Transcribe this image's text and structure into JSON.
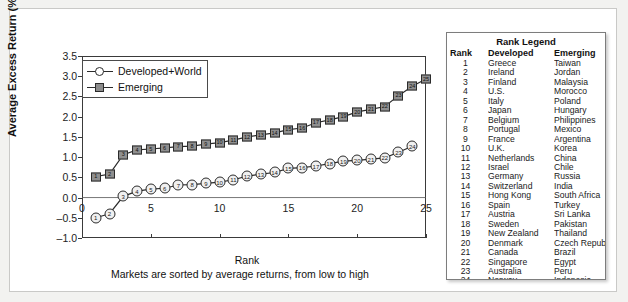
{
  "chart_data": {
    "type": "line",
    "title": "",
    "xlabel": "Rank",
    "xsublabel": "Markets are sorted by average returns, from low to high",
    "ylabel": "Average Excess Return (%/month)",
    "xlim": [
      0,
      25
    ],
    "ylim": [
      -1.0,
      3.5
    ],
    "xticks": [
      "0",
      "5",
      "10",
      "15",
      "20",
      "25"
    ],
    "xtick_values": [
      0,
      5,
      10,
      15,
      20,
      25
    ],
    "yticks": [
      "-1.0",
      "-0.5",
      "0.0",
      "0.5",
      "1.0",
      "1.5",
      "2.0",
      "2.5",
      "3.0",
      "3.5"
    ],
    "ytick_values": [
      -1.0,
      -0.5,
      0.0,
      0.5,
      1.0,
      1.5,
      2.0,
      2.5,
      3.0,
      3.5
    ],
    "grid": false,
    "legend_position": "upper-left-inside",
    "series": [
      {
        "name": "Developed+World",
        "marker": "circle-open",
        "x": [
          1,
          2,
          3,
          4,
          5,
          6,
          7,
          8,
          9,
          10,
          11,
          12,
          13,
          14,
          15,
          16,
          17,
          18,
          19,
          20,
          21,
          22,
          23,
          24
        ],
        "values": [
          -0.5,
          -0.4,
          0.03,
          0.16,
          0.21,
          0.23,
          0.31,
          0.32,
          0.35,
          0.38,
          0.44,
          0.53,
          0.58,
          0.62,
          0.72,
          0.74,
          0.78,
          0.84,
          0.9,
          0.92,
          0.95,
          0.98,
          1.12,
          1.27
        ]
      },
      {
        "name": "Emerging",
        "marker": "square-filled",
        "x": [
          1,
          2,
          3,
          4,
          5,
          6,
          7,
          8,
          9,
          10,
          11,
          12,
          13,
          14,
          15,
          16,
          17,
          18,
          19,
          20,
          21,
          22,
          23,
          24,
          25
        ],
        "values": [
          0.52,
          0.58,
          1.06,
          1.18,
          1.2,
          1.23,
          1.26,
          1.27,
          1.32,
          1.36,
          1.42,
          1.5,
          1.55,
          1.6,
          1.68,
          1.72,
          1.85,
          1.92,
          2.0,
          2.12,
          2.18,
          2.25,
          2.52,
          2.75,
          2.93
        ]
      }
    ]
  },
  "rank_legend": {
    "title": "Rank Legend",
    "headers": [
      "Rank",
      "Developed",
      "Emerging"
    ],
    "rows": [
      [
        "1",
        "Greece",
        "Taiwan"
      ],
      [
        "2",
        "Ireland",
        "Jordan"
      ],
      [
        "3",
        "Finland",
        "Malaysia"
      ],
      [
        "4",
        "U.S.",
        "Morocco"
      ],
      [
        "5",
        "Italy",
        "Poland"
      ],
      [
        "6",
        "Japan",
        "Hungary"
      ],
      [
        "7",
        "Belgium",
        "Philippines"
      ],
      [
        "8",
        "Portugal",
        "Mexico"
      ],
      [
        "9",
        "France",
        "Argentina"
      ],
      [
        "10",
        "U.K.",
        "Korea"
      ],
      [
        "11",
        "Netherlands",
        "China"
      ],
      [
        "12",
        "Israel",
        "Chile"
      ],
      [
        "13",
        "Germany",
        "Russia"
      ],
      [
        "14",
        "Switzerland",
        "India"
      ],
      [
        "15",
        "Hong Kong",
        "South Africa"
      ],
      [
        "16",
        "Spain",
        "Turkey"
      ],
      [
        "17",
        "Austria",
        "Sri Lanka"
      ],
      [
        "18",
        "Sweden",
        "Pakistan"
      ],
      [
        "19",
        "New Zealand",
        "Thailand"
      ],
      [
        "20",
        "Denmark",
        "Czech Republic"
      ],
      [
        "21",
        "Canada",
        "Brazil"
      ],
      [
        "22",
        "Singapore",
        "Egypt"
      ],
      [
        "23",
        "Australia",
        "Peru"
      ],
      [
        "24",
        "Norway",
        "Indonesia"
      ],
      [
        "25",
        "",
        "Colombia"
      ]
    ]
  },
  "colors": {
    "line": "#2b2b2b",
    "emerging_fill": "#8f8f8f",
    "developed_fill": "#f0f0f0",
    "page_bg": "#f2f2f0",
    "panel_bg": "#ffffff"
  }
}
